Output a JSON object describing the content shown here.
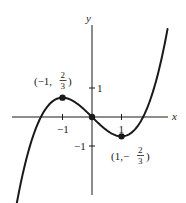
{
  "chart_data": {
    "type": "line",
    "title": "",
    "function": "y = x^3/3 - x",
    "xlabel": "x",
    "ylabel": "y",
    "xlim": [
      -3,
      3
    ],
    "ylim": [
      -3,
      3
    ],
    "grid": false,
    "legend": null,
    "x_ticks": [
      {
        "value": -1,
        "label": "−1"
      },
      {
        "value": 1,
        "label": "1"
      }
    ],
    "y_ticks": [
      {
        "value": 1,
        "label": "1"
      },
      {
        "value": -1,
        "label": "−1"
      }
    ],
    "series": [
      {
        "name": "cubic",
        "x": [
          -2.6,
          -2.4,
          -2.2,
          -2.0,
          -1.8,
          -1.6,
          -1.4,
          -1.2,
          -1.0,
          -0.8,
          -0.6,
          -0.4,
          -0.2,
          0.0,
          0.2,
          0.4,
          0.6,
          0.8,
          1.0,
          1.2,
          1.4,
          1.6,
          1.8,
          2.0,
          2.2,
          2.4,
          2.6
        ],
        "y": [
          -3.259,
          -2.208,
          -1.349,
          -0.667,
          -0.144,
          0.235,
          0.485,
          0.624,
          0.667,
          0.629,
          0.528,
          0.379,
          0.197,
          0.0,
          -0.197,
          -0.379,
          -0.528,
          -0.629,
          -0.667,
          -0.624,
          -0.485,
          -0.235,
          0.144,
          0.667,
          1.349,
          2.208,
          3.259
        ]
      }
    ],
    "points": [
      {
        "x": -1,
        "y": 0.6667,
        "label_prefix": "(−1,",
        "num": "2",
        "den": "3",
        "label_suffix": ")"
      },
      {
        "x": 0,
        "y": 0,
        "label_prefix": "",
        "num": "",
        "den": "",
        "label_suffix": ""
      },
      {
        "x": 1,
        "y": -0.6667,
        "label_prefix": "(1,−",
        "num": "2",
        "den": "3",
        "label_suffix": ")"
      }
    ],
    "annotations": [
      "(−1, 2/3)",
      "(1, −2/3)"
    ]
  },
  "labels": {
    "x_axis": "x",
    "y_axis": "y",
    "tick_x_neg1": "−1",
    "tick_x_pos1": "1",
    "tick_y_pos1": "1",
    "tick_y_neg1": "−1",
    "max_prefix": "(−1,",
    "max_num": "2",
    "max_den": "3",
    "max_suffix": ")",
    "min_prefix": "(1,−",
    "min_num": "2",
    "min_den": "3",
    "min_suffix": ")"
  },
  "colors": {
    "ink": "#1a1a1a",
    "background": "#ffffff"
  }
}
